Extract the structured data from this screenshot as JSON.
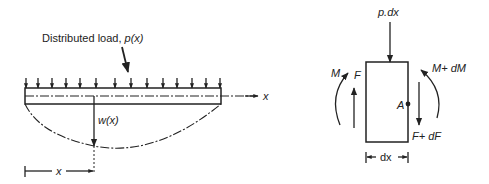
{
  "beam_diagram": {
    "load_label_prefix": "Distributed load, ",
    "load_label_func": "p(x)",
    "axis_label": "x",
    "deflection_label": "w(x)",
    "position_label": "x",
    "load_arrow_count": 14
  },
  "element_diagram": {
    "top_load_label": "p.dx",
    "left_moment_label": "M",
    "left_shear_label": "F",
    "right_moment_label": "M+ dM",
    "right_shear_label": "F+ dF",
    "point_label": "A",
    "width_label": "dx"
  }
}
